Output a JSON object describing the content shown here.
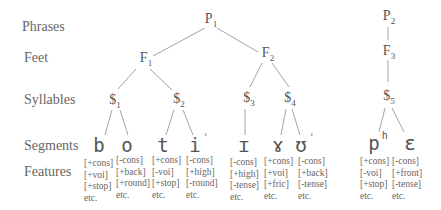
{
  "levels": {
    "phrases": "Phrases",
    "feet": "Feet",
    "syllables": "Syllables",
    "segments": "Segments",
    "features": "Features"
  },
  "phrases": [
    {
      "base": "P",
      "sub": "1"
    },
    {
      "base": "P",
      "sub": "2"
    }
  ],
  "feet": [
    {
      "base": "F",
      "sub": "1"
    },
    {
      "base": "F",
      "sub": "2"
    },
    {
      "base": "F",
      "sub": "3"
    }
  ],
  "syllables": [
    {
      "base": "$",
      "sub": "1"
    },
    {
      "base": "$",
      "sub": "2"
    },
    {
      "base": "$",
      "sub": "3"
    },
    {
      "base": "$",
      "sub": "4"
    },
    {
      "base": "$",
      "sub": "5"
    }
  ],
  "segments": [
    {
      "symbol": "b",
      "mark": ""
    },
    {
      "symbol": "o",
      "mark": ""
    },
    {
      "symbol": "t",
      "mark": ""
    },
    {
      "symbol": "i",
      "mark": "ˈ"
    },
    {
      "symbol": "ɪ",
      "mark": ""
    },
    {
      "symbol": "ɤ",
      "mark": ""
    },
    {
      "symbol": "ʊ",
      "mark": "ˈ"
    },
    {
      "symbol": "p",
      "mark": "h"
    },
    {
      "symbol": "ɛ",
      "mark": ""
    }
  ],
  "features": [
    [
      "[+cons]",
      "[+voi]",
      "[+stop]",
      "etc."
    ],
    [
      "[-cons]",
      "[+back]",
      "[+round]",
      "etc."
    ],
    [
      "[+cons]",
      "[-voi]",
      "[+stop]",
      "etc."
    ],
    [
      "[-cons]",
      "[+high]",
      "[-round]",
      "etc."
    ],
    [
      "[-cons]",
      "[+high]",
      "[-tense]",
      "etc."
    ],
    [
      "[+cons]",
      "[+voi]",
      "[+fric]",
      "etc."
    ],
    [
      "[-cons]",
      "[+back]",
      "[-tense]",
      "etc."
    ],
    [
      "[+cons]",
      "[-voi]",
      "[+stop]",
      "etc."
    ],
    [
      "[-cons]",
      "[+front]",
      "[-tense]",
      "etc."
    ]
  ],
  "colors": {
    "line": "#888888",
    "text": "#555555"
  }
}
